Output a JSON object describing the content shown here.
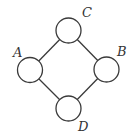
{
  "diagram": {
    "type": "graph",
    "nodes": [
      {
        "id": "C",
        "label": "C",
        "cx": 68.5,
        "cy": 30.5,
        "r": 12.5,
        "lx": 82,
        "ly": 17
      },
      {
        "id": "A",
        "label": "A",
        "cx": 30,
        "cy": 70,
        "r": 12.5,
        "lx": 13,
        "ly": 57
      },
      {
        "id": "B",
        "label": "B",
        "cx": 106.5,
        "cy": 69.5,
        "r": 12.5,
        "lx": 117,
        "ly": 56
      },
      {
        "id": "D",
        "label": "D",
        "cx": 68.5,
        "cy": 108.5,
        "r": 12.5,
        "lx": 78,
        "ly": 131
      }
    ],
    "edges": [
      {
        "from": "A",
        "to": "C"
      },
      {
        "from": "C",
        "to": "B"
      },
      {
        "from": "B",
        "to": "D"
      },
      {
        "from": "D",
        "to": "A"
      }
    ]
  }
}
